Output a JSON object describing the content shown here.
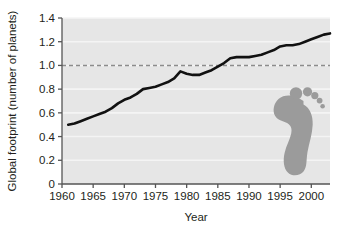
{
  "chart_data": {
    "type": "line",
    "title": "",
    "subtitle": "",
    "xlabel": "Year",
    "ylabel": "Global footprint (number of planets)",
    "xlim": [
      1960,
      2003
    ],
    "ylim": [
      0,
      1.4
    ],
    "xticks": [
      1960,
      1965,
      1970,
      1975,
      1980,
      1985,
      1990,
      1995,
      2000
    ],
    "yticks": [
      0,
      0.2,
      0.4,
      0.6,
      0.8,
      1.0,
      1.2,
      1.4
    ],
    "ytick_labels": [
      "0",
      "0.2",
      "0.4",
      "0.6",
      "0.8",
      "1.0",
      "1.2",
      "1.4"
    ],
    "xtick_labels": [
      "1960",
      "1965",
      "1970",
      "1975",
      "1980",
      "1985",
      "1990",
      "1995",
      "2000"
    ],
    "grid": true,
    "grid_color": "#f4f4f4",
    "plot_background": "#e6e6e6",
    "legend": null,
    "legend_position": "none",
    "series": [
      {
        "name": "Global footprint",
        "color": "#111111",
        "line_width": 2.6,
        "style": "solid",
        "x": [
          1961,
          1962,
          1963,
          1964,
          1965,
          1966,
          1967,
          1968,
          1969,
          1970,
          1971,
          1972,
          1973,
          1974,
          1975,
          1976,
          1977,
          1978,
          1979,
          1980,
          1981,
          1982,
          1983,
          1984,
          1985,
          1986,
          1987,
          1988,
          1989,
          1990,
          1991,
          1992,
          1993,
          1994,
          1995,
          1996,
          1997,
          1998,
          1999,
          2000,
          2001,
          2002,
          2003
        ],
        "y": [
          0.5,
          0.51,
          0.53,
          0.55,
          0.57,
          0.59,
          0.61,
          0.64,
          0.68,
          0.71,
          0.73,
          0.76,
          0.8,
          0.81,
          0.82,
          0.84,
          0.86,
          0.89,
          0.95,
          0.93,
          0.92,
          0.92,
          0.94,
          0.96,
          0.99,
          1.02,
          1.06,
          1.07,
          1.07,
          1.07,
          1.08,
          1.09,
          1.11,
          1.13,
          1.16,
          1.17,
          1.17,
          1.18,
          1.2,
          1.22,
          1.24,
          1.26,
          1.27
        ]
      }
    ],
    "reference_lines": [
      {
        "name": "one-planet-threshold",
        "orientation": "horizontal",
        "value": 1.0,
        "style": "dashed",
        "color": "#8c8c8c",
        "label": ""
      }
    ],
    "annotations": [
      {
        "name": "footprint-graphic",
        "type": "illustration",
        "description": "footprint",
        "color": "#9b9b9b",
        "x": 1997.5,
        "y": 0.42
      }
    ]
  }
}
